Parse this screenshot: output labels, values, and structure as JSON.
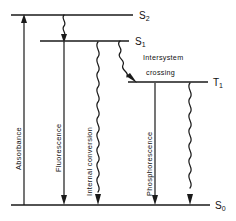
{
  "figure": {
    "kind": "jablonski-energy-level-diagram",
    "background_color": "#ffffff",
    "ink_color": "#1a1a1a"
  },
  "states": {
    "s2": {
      "label": "S",
      "subscript": "2",
      "full": "S2"
    },
    "s1": {
      "label": "S",
      "subscript": "1",
      "full": "S1"
    },
    "t1": {
      "label": "T",
      "subscript": "1",
      "full": "T1"
    },
    "s0": {
      "label": "S",
      "subscript": "0",
      "full": "S0"
    }
  },
  "process_labels": {
    "absorbance": "Absorbance",
    "fluorescence": "Fluorescence",
    "internal_conversion": "Internal conversion",
    "phosphorescence": "Phosphorescence",
    "intersystem_line1": "Intersystem",
    "intersystem_line2": "crossing"
  }
}
